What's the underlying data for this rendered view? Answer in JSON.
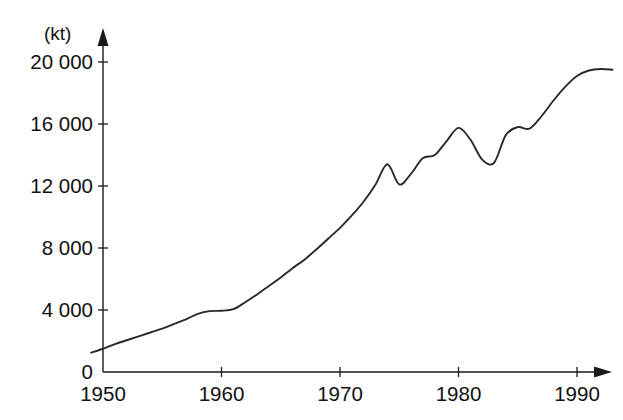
{
  "chart_data": {
    "type": "line",
    "title": "",
    "subtitle": "",
    "xlabel": "",
    "ylabel": "",
    "unit_label": "(kt)",
    "grid": false,
    "legend": "none",
    "xlim": [
      1949,
      1993
    ],
    "ylim": [
      0,
      21500
    ],
    "xticks": [
      1950,
      1960,
      1970,
      1980,
      1990
    ],
    "xticklabels": [
      "1950",
      "1960",
      "1970",
      "1980",
      "1990"
    ],
    "yticks": [
      0,
      4000,
      8000,
      12000,
      16000,
      20000
    ],
    "yticklabels": [
      "0",
      "4 000",
      "8 000",
      "12 000",
      "16 000",
      "20 000"
    ],
    "line_color": "#2a2a2a",
    "axis_color": "#1a1a1a",
    "series": [
      {
        "name": "",
        "x": [
          1949,
          1950,
          1951,
          1952,
          1953,
          1954,
          1955,
          1956,
          1957,
          1958,
          1959,
          1960,
          1961,
          1962,
          1963,
          1964,
          1965,
          1966,
          1967,
          1968,
          1969,
          1970,
          1971,
          1972,
          1973,
          1974,
          1975,
          1976,
          1977,
          1978,
          1979,
          1980,
          1981,
          1982,
          1983,
          1984,
          1985,
          1986,
          1987,
          1988,
          1989,
          1990,
          1991,
          1992,
          1993
        ],
        "values": [
          1250,
          1500,
          1800,
          2050,
          2300,
          2550,
          2800,
          3100,
          3400,
          3750,
          3930,
          3950,
          4050,
          4500,
          5000,
          5550,
          6100,
          6700,
          7250,
          7900,
          8600,
          9300,
          10100,
          11000,
          12100,
          13400,
          12100,
          12800,
          13800,
          14000,
          14900,
          15750,
          15000,
          13700,
          13500,
          15300,
          15800,
          15700,
          16500,
          17500,
          18400,
          19100,
          19450,
          19550,
          19500
        ]
      }
    ]
  },
  "geometry": {
    "origin_x": 103,
    "origin_y": 372,
    "x_per_year": 11.85,
    "y_per_unit": 0.0155,
    "x_zero_year": 1950
  }
}
